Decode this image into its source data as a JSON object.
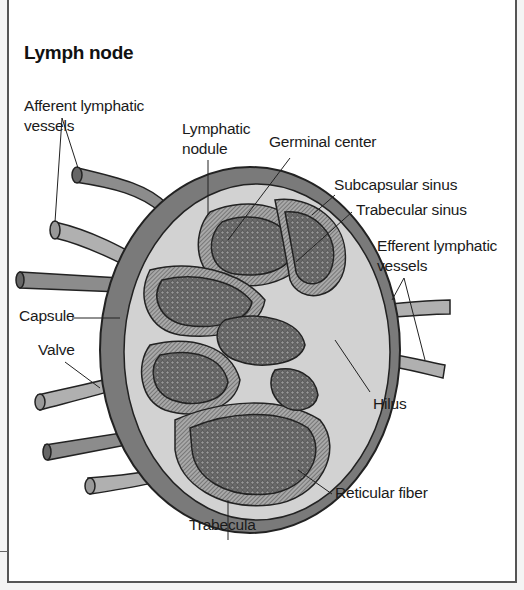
{
  "title": "Lymph node",
  "labels": {
    "afferent_1": "Afferent lymphatic",
    "afferent_2": "vessels",
    "lymphatic_nodule_1": "Lymphatic",
    "lymphatic_nodule_2": "nodule",
    "germinal_center": "Germinal center",
    "subcapsular_sinus": "Subcapsular sinus",
    "trabecular_sinus": "Trabecular sinus",
    "efferent_1": "Efferent lymphatic",
    "efferent_2": "vessels",
    "capsule": "Capsule",
    "valve": "Valve",
    "hilus": "Hilus",
    "reticular_fiber": "Reticular fiber",
    "trabecula": "Trabecula"
  },
  "colors": {
    "capsule": "#7a7a7a",
    "sinus": "#d2d2d2",
    "nodule": "#5a5a5a",
    "vessel": "#8c8c8c",
    "outline": "#222222"
  }
}
